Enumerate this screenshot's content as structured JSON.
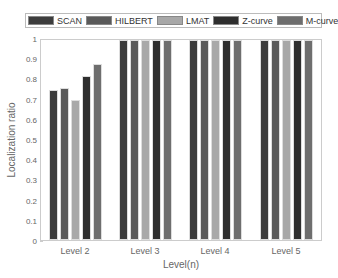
{
  "chart_data": {
    "type": "bar",
    "title": "",
    "xlabel": "Level(n)",
    "ylabel": "Localization ratio",
    "ylim": [
      0,
      1
    ],
    "yticks": [
      "0",
      "0.1",
      "0.2",
      "0.3",
      "0.4",
      "0.5",
      "0.6",
      "0.7",
      "0.8",
      "0.9",
      "1"
    ],
    "grid": false,
    "legend_position": "top",
    "categories": [
      "Level 2",
      "Level 3",
      "Level 4",
      "Level 5"
    ],
    "series": [
      {
        "name": "SCAN",
        "color": "#3d3d3d",
        "values": [
          0.75,
          1,
          1,
          1
        ]
      },
      {
        "name": "HILBERT",
        "color": "#5a5a5a",
        "values": [
          0.76,
          1,
          1,
          1
        ]
      },
      {
        "name": "LMAT",
        "color": "#a8a8a8",
        "values": [
          0.7,
          1,
          1,
          1
        ]
      },
      {
        "name": "Z-curve",
        "color": "#2e2e2e",
        "values": [
          0.82,
          1,
          1,
          1
        ]
      },
      {
        "name": "M-curve",
        "color": "#6e6e6e",
        "values": [
          0.88,
          1,
          1,
          1
        ]
      }
    ]
  }
}
